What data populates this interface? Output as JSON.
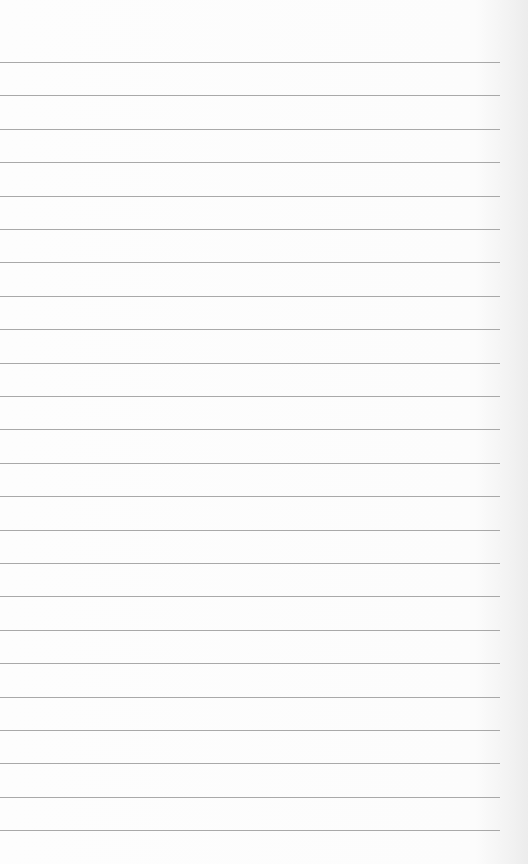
{
  "page": {
    "type": "lined-paper",
    "background_color": "#fcfcfc",
    "line_color": "#9a9a9a",
    "line_count": 24,
    "first_line_y": 62,
    "line_spacing": 33.4,
    "line_width": 500
  }
}
